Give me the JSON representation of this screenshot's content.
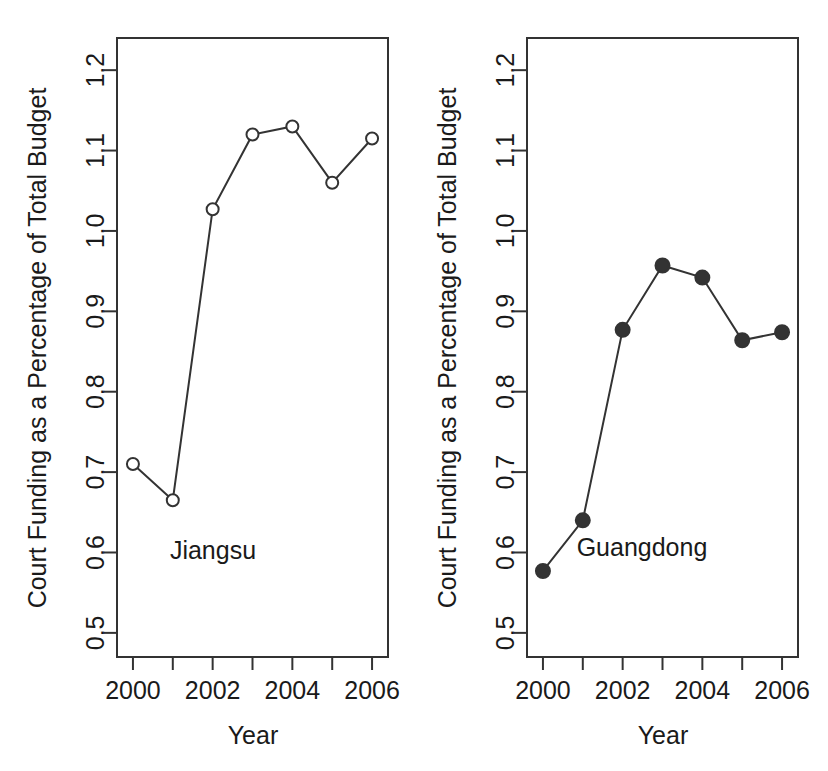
{
  "figure": {
    "background": "#ffffff",
    "line_color": "#333333",
    "axis_color": "#333333",
    "text_color": "#1a1a1a"
  },
  "chart_data": [
    {
      "type": "line",
      "title": "",
      "series_label": "Jiangsu",
      "xlabel": "Year",
      "ylabel": "Court Funding as a Percentage of Total Budget",
      "x": [
        2000,
        2001,
        2002,
        2003,
        2004,
        2005,
        2006
      ],
      "values": [
        0.71,
        0.665,
        1.027,
        1.12,
        1.13,
        1.06,
        1.115
      ],
      "xlim": [
        1999.6,
        2006.4
      ],
      "ylim": [
        0.47,
        1.24
      ],
      "xticks": [
        2000,
        2001,
        2002,
        2003,
        2004,
        2005,
        2006
      ],
      "xtick_labels": [
        "2000",
        "",
        "2002",
        "",
        "2004",
        "",
        "2006"
      ],
      "yticks": [
        0.5,
        0.6,
        0.7,
        0.8,
        0.9,
        1.0,
        1.1,
        1.2
      ],
      "ytick_labels": [
        "0.5",
        "0.6",
        "0.7",
        "0.8",
        "0.9",
        "1.0",
        "1.1",
        "1.2"
      ],
      "marker": "open-circle",
      "grid": false,
      "legend": "none"
    },
    {
      "type": "line",
      "title": "",
      "series_label": "Guangdong",
      "xlabel": "Year",
      "ylabel": "Court Funding as a Percentage of Total Budget",
      "x": [
        2000,
        2001,
        2002,
        2003,
        2004,
        2005,
        2006
      ],
      "values": [
        0.577,
        0.64,
        0.877,
        0.957,
        0.942,
        0.864,
        0.874
      ],
      "xlim": [
        1999.6,
        2006.4
      ],
      "ylim": [
        0.47,
        1.24
      ],
      "xticks": [
        2000,
        2001,
        2002,
        2003,
        2004,
        2005,
        2006
      ],
      "xtick_labels": [
        "2000",
        "",
        "2002",
        "",
        "2004",
        "",
        "2006"
      ],
      "yticks": [
        0.5,
        0.6,
        0.7,
        0.8,
        0.9,
        1.0,
        1.1,
        1.2
      ],
      "ytick_labels": [
        "0.5",
        "0.6",
        "0.7",
        "0.8",
        "0.9",
        "1.0",
        "1.1",
        "1.2"
      ],
      "marker": "filled-circle",
      "grid": false,
      "legend": "none"
    }
  ]
}
